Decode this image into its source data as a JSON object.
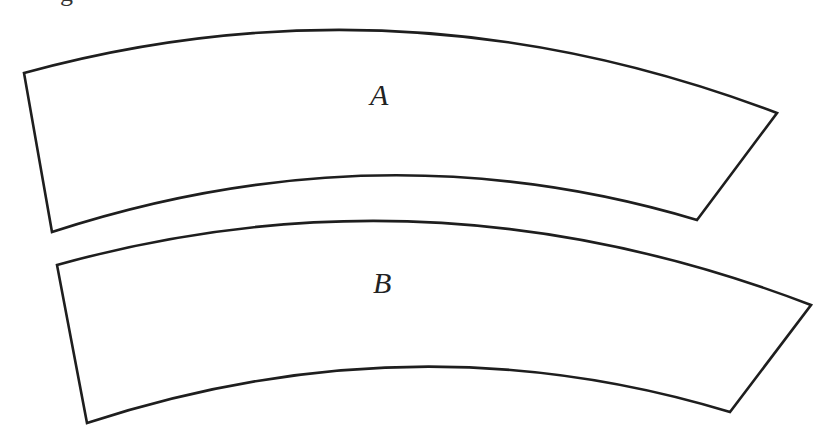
{
  "clipped_caption_fragment": "g",
  "shapes": [
    {
      "id": "A",
      "label": "A",
      "corners": {
        "top_left": [
          24,
          73
        ],
        "top_right": [
          777,
          113
        ],
        "bottom_right": [
          697,
          220
        ],
        "bottom_left": [
          52,
          232
        ]
      },
      "top_arc_peak": [
        413,
        20
      ],
      "bottom_arc_peak": [
        413,
        177
      ],
      "label_pos": [
        372,
        80
      ]
    },
    {
      "id": "B",
      "label": "B",
      "corners": {
        "top_left": [
          57,
          265
        ],
        "top_right": [
          811,
          305
        ],
        "bottom_right": [
          730,
          412
        ],
        "bottom_left": [
          87,
          423
        ]
      },
      "top_arc_peak": [
        413,
        211
      ],
      "bottom_arc_peak": [
        413,
        368
      ],
      "label_pos": [
        375,
        270
      ]
    }
  ],
  "colors": {
    "stroke": "#1e1e1e",
    "fill": "#ffffff",
    "background": "#ffffff"
  }
}
